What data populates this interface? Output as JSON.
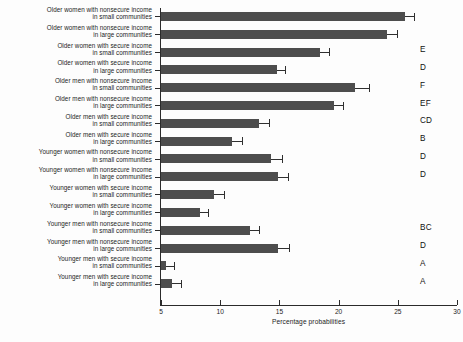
{
  "chart_data": {
    "type": "bar",
    "orientation": "horizontal",
    "title": "",
    "xlabel": "Percentage probabilities",
    "ylabel": "",
    "xlim": [
      5,
      30
    ],
    "xticks": [
      5,
      10,
      15,
      20,
      25,
      30
    ],
    "xtick_labels": [
      "5",
      "10",
      "15",
      "20",
      "25",
      "30"
    ],
    "grid": false,
    "legend": null,
    "bar_color": "#4d4d4d",
    "error_bars": true,
    "categories": [
      "Older women with nonsecure income in small communities",
      "Older women with nonsecure income in large communities",
      "Older women with secure income in small communities",
      "Older women with secure income in large communities",
      "Older men with nonsecure income in small communities",
      "Older men with nonsecure income in large communities",
      "Older men with secure income in small communities",
      "Older men with secure income in large communities",
      "Younger women with nonsecure income in small communities",
      "Younger women with nonsecure income in large communities",
      "Younger women with secure income in small communities",
      "Younger women with secure income in large communities",
      "Younger men with nonsecure income in small communities",
      "Younger men with nonsecure income in large communities",
      "Younger men with secure income in small communities",
      "Younger men with secure income in large communities"
    ],
    "values": [
      25.6,
      24.1,
      18.4,
      14.8,
      21.4,
      19.6,
      13.3,
      11.0,
      14.3,
      14.9,
      9.5,
      8.3,
      12.5,
      14.9,
      5.4,
      5.9
    ],
    "errors_upper": [
      26.4,
      24.9,
      19.2,
      15.5,
      22.6,
      20.4,
      14.1,
      11.8,
      15.2,
      15.7,
      10.3,
      9.0,
      13.3,
      15.8,
      6.1,
      6.7
    ],
    "group_letters": [
      "",
      "",
      "E",
      "D",
      "F",
      "EF",
      "CD",
      "B",
      "D",
      "D",
      "",
      "",
      "BC",
      "D",
      "A",
      "A"
    ]
  },
  "rows": [
    {
      "line1": "Older women with nonsecure income",
      "line2": "in small communities"
    },
    {
      "line1": "Older women with nonsecure income",
      "line2": "in large communities"
    },
    {
      "line1": "Older women with secure income",
      "line2": "in small communities"
    },
    {
      "line1": "Older women with secure income",
      "line2": "in large communities"
    },
    {
      "line1": "Older men with nonsecure income",
      "line2": "in small communities"
    },
    {
      "line1": "Older men with nonsecure income",
      "line2": "in large communities"
    },
    {
      "line1": "Older men with secure income",
      "line2": "in small communities"
    },
    {
      "line1": "Older men with secure income",
      "line2": "in large communities"
    },
    {
      "line1": "Younger women with nonsecure income",
      "line2": "in small communities"
    },
    {
      "line1": "Younger women with nonsecure income",
      "line2": "in large communities"
    },
    {
      "line1": "Younger women with secure income",
      "line2": "in small communities"
    },
    {
      "line1": "Younger women with secure income",
      "line2": "in large communities"
    },
    {
      "line1": "Younger men with nonsecure income",
      "line2": "in small communities"
    },
    {
      "line1": "Younger men with nonsecure income",
      "line2": "in large communities"
    },
    {
      "line1": "Younger men with secure income",
      "line2": "in small communities"
    },
    {
      "line1": "Younger men with secure income",
      "line2": "in large communities"
    }
  ]
}
